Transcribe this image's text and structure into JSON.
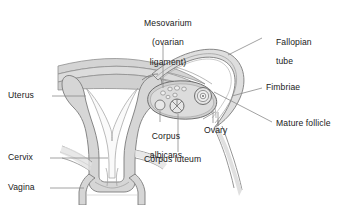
{
  "diagram": {
    "background_color": "#ffffff",
    "outline_color": "#6e6e6e",
    "tissue_fill": "#d6d6d6",
    "cavity_fill": "#f7f7f7",
    "ligament_fill": "#d0d0d0",
    "label_color": "#1a1a1a",
    "leader_color": "#8a8a8a"
  },
  "labels": {
    "mesovarium": {
      "line1": "Mesovarium",
      "line2": "(ovarian",
      "line3": "ligament)"
    },
    "fallopian_tube": {
      "line1": "Fallopian",
      "line2": "tube"
    },
    "fimbriae": "Fimbriae",
    "mature_follicle": "Mature follicle",
    "ovary": "Ovary",
    "corpus_luteum": "Corpus luteum",
    "corpus_albicans": {
      "line1": "Corpus",
      "line2": "albicans"
    },
    "uterus": "Uterus",
    "cervix": "Cervix",
    "vagina": "Vagina"
  },
  "structures": [
    {
      "name": "uterus",
      "kind": "organ"
    },
    {
      "name": "cervix",
      "kind": "organ"
    },
    {
      "name": "vagina",
      "kind": "organ"
    },
    {
      "name": "fallopian-tube",
      "kind": "organ"
    },
    {
      "name": "fimbriae",
      "kind": "organ"
    },
    {
      "name": "ovary",
      "kind": "organ"
    },
    {
      "name": "mesovarium",
      "kind": "ligament"
    },
    {
      "name": "mature-follicle",
      "kind": "follicle"
    },
    {
      "name": "corpus-luteum",
      "kind": "follicle"
    },
    {
      "name": "corpus-albicans",
      "kind": "follicle"
    }
  ]
}
